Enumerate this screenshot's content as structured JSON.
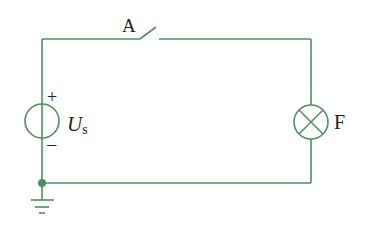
{
  "diagram": {
    "type": "circuit",
    "wire_color": "#4e9160",
    "components": {
      "switch": {
        "label": "A",
        "state": "open"
      },
      "source": {
        "label_main": "U",
        "label_sub": "s",
        "plus": "+",
        "minus": "−"
      },
      "lamp": {
        "label": "F"
      },
      "ground": {
        "present": true
      }
    }
  }
}
